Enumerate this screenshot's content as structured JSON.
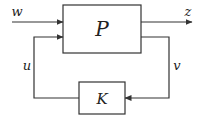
{
  "diagram": {
    "colors": {
      "stroke": "#333333",
      "background": "#ffffff",
      "text": "#222222"
    },
    "blocks": [
      {
        "id": "P",
        "label": "P",
        "x": 63,
        "y": 5,
        "w": 78,
        "h": 48
      },
      {
        "id": "K",
        "label": "K",
        "x": 79,
        "y": 82,
        "w": 46,
        "h": 32
      }
    ],
    "signals": [
      {
        "id": "w",
        "label": "w",
        "role": "exogenous input"
      },
      {
        "id": "z",
        "label": "z",
        "role": "regulated output"
      },
      {
        "id": "u",
        "label": "u",
        "role": "control input"
      },
      {
        "id": "v",
        "label": "v",
        "role": "measured output"
      }
    ]
  }
}
